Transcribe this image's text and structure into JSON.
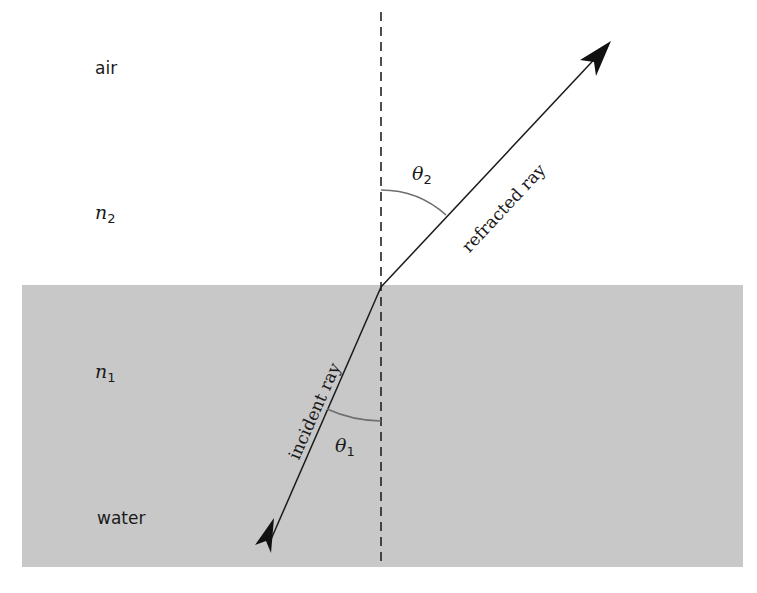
{
  "regions": {
    "upper": {
      "medium": "air",
      "index_symbol": "n",
      "index_sub": "2"
    },
    "lower": {
      "medium": "water",
      "index_symbol": "n",
      "index_sub": "1"
    }
  },
  "rays": {
    "incident": {
      "label": "incident ray"
    },
    "refracted": {
      "label": "refracted ray"
    }
  },
  "angles": {
    "theta1": {
      "symbol": "θ",
      "sub": "1"
    },
    "theta2": {
      "symbol": "θ",
      "sub": "2"
    }
  },
  "colors": {
    "water_fill": "#c8c8c8",
    "ray": "#1a1a1a",
    "angle_arc": "#6e6e6e",
    "normal": "#222222",
    "background": "#ffffff"
  }
}
